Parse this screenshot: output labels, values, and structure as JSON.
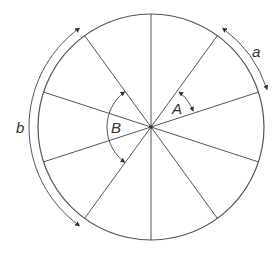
{
  "diagram": {
    "type": "circle-divided-into-equal-sectors",
    "sectors": 10,
    "center": [
      151,
      127
    ],
    "radius": 113,
    "spoke_angles_deg": [
      90,
      126,
      162,
      198,
      234,
      270,
      306,
      342,
      18,
      54
    ],
    "colors": {
      "line": "#555555",
      "text": "#333333",
      "background": "#ffffff"
    },
    "arcs": {
      "a": {
        "label": "a",
        "description": "arc length spanning one sector",
        "from_deg": 54,
        "to_deg": 18,
        "radius": 122
      },
      "b": {
        "label": "b",
        "description": "arc length spanning three sectors",
        "from_deg": 126,
        "to_deg": 234,
        "radius": 122
      }
    },
    "angles": {
      "A": {
        "label": "A",
        "description": "central angle of one sector",
        "from_deg": 51,
        "to_deg": 21,
        "radius": 45
      },
      "B": {
        "label": "B",
        "description": "central angle of three sectors",
        "from_deg": 127,
        "to_deg": 233,
        "radius": 44
      }
    }
  }
}
